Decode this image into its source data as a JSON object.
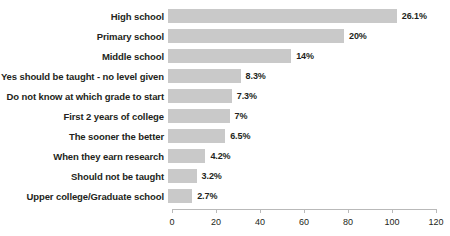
{
  "chart_data": {
    "type": "bar",
    "orientation": "horizontal",
    "title": "",
    "xlabel": "",
    "ylabel": "",
    "xlim": [
      0,
      120
    ],
    "grid": false,
    "legend": null,
    "bar_color": "#c9c9c9",
    "label_color": "#231f20",
    "axis_color": "#b9b9b9",
    "xticks": [
      0,
      20,
      40,
      60,
      80,
      100,
      120
    ],
    "xtick_labels": [
      "0",
      "20",
      "40",
      "60",
      "80",
      "100",
      "120"
    ],
    "categories": [
      "High school",
      "Primary school",
      "Middle school",
      "Yes should be taught - no level given",
      "Do not know at which grade to start",
      "First 2 years of college",
      "The sooner the better",
      "When they earn research",
      "Should not be taught",
      "Upper college/Graduate school"
    ],
    "values": [
      104,
      80,
      56,
      33,
      29,
      28,
      26,
      17,
      13,
      11
    ],
    "data_labels": [
      "26.1%",
      "20%",
      "14%",
      "8.3%",
      "7.3%",
      "7%",
      "6.5%",
      "4.2%",
      "3.2%",
      "2.7%"
    ],
    "percentages": [
      26.1,
      20,
      14,
      8.3,
      7.3,
      7,
      6.5,
      4.2,
      3.2,
      2.7
    ]
  }
}
